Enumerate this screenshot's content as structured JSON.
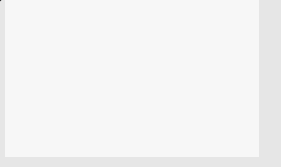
{
  "chart_data": {
    "type": "line",
    "title": "",
    "xlabel": "x",
    "ylabel": "y",
    "xlim": [
      -3,
      3
    ],
    "ylim": [
      0,
      7
    ],
    "x_ticks": [
      "−3",
      "−2",
      "−1",
      "0",
      "1",
      "2",
      "3"
    ],
    "y_ticks": [
      "1",
      "2",
      "3",
      "4",
      "5",
      "6"
    ],
    "grid": true,
    "series": [
      {
        "name": "y = x²",
        "function": "x^2",
        "x": [
          -2.6,
          -2,
          -1.5,
          -1,
          -0.5,
          0,
          0.5,
          1,
          1.5,
          2,
          2.6
        ],
        "values": [
          6.76,
          4,
          2.25,
          1,
          0.25,
          0,
          0.25,
          1,
          2.25,
          4,
          6.76
        ]
      }
    ],
    "annotations": [
      {
        "text": "y = x²",
        "position": "top-right near curve"
      },
      {
        "type": "pointer-line",
        "from": [
          1.7,
          2.2
        ],
        "to": "right edge (outside plot)"
      }
    ]
  },
  "labels": {
    "curve": "y = x",
    "curve_exp": "2",
    "x_axis": "x",
    "y_axis": "y"
  },
  "x_tick_labels": [
    "−3",
    "−2",
    "−1",
    "0",
    "1",
    "2",
    "3"
  ],
  "y_tick_labels": [
    "1",
    "2",
    "3",
    "4",
    "5",
    "6"
  ]
}
